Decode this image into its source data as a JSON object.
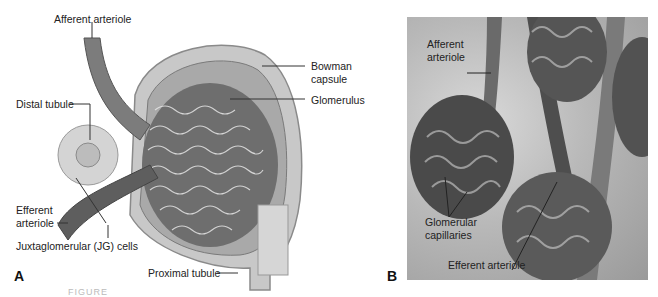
{
  "figure": {
    "panel_a": {
      "letter": "A",
      "labels": {
        "afferent_arteriole": "Afferent arteriole",
        "bowman_capsule_line1": "Bowman",
        "bowman_capsule_line2": "capsule",
        "glomerulus": "Glomerulus",
        "distal_tubule": "Distal tubule",
        "efferent_arteriole_line1": "Efferent",
        "efferent_arteriole_line2": "arteriole",
        "jg_cells": "Juxtaglomerular (JG) cells",
        "proximal_tubule": "Proximal tubule"
      }
    },
    "panel_b": {
      "letter": "B",
      "labels": {
        "afferent_arteriole_line1": "Afferent",
        "afferent_arteriole_line2": "arteriole",
        "glomerular_capillaries_line1": "Glomerular",
        "glomerular_capillaries_line2": "capillaries",
        "efferent_arteriole": "Efferent arteriole"
      }
    },
    "caption_partial": "FIGURE"
  }
}
